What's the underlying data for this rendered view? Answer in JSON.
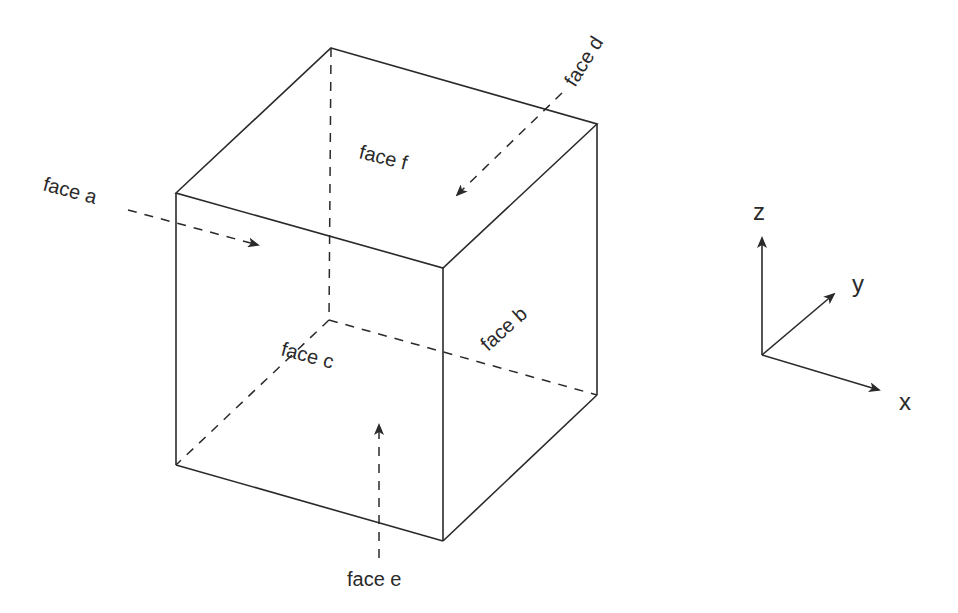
{
  "diagram": {
    "type": "cube-with-labeled-faces",
    "faces": {
      "a": "face a",
      "b": "face b",
      "c": "face c",
      "d": "face d",
      "e": "face e",
      "f": "face f"
    },
    "axes": {
      "x": "x",
      "y": "y",
      "z": "z"
    }
  },
  "colors": {
    "line": "#2a2a2a",
    "background": "#ffffff"
  }
}
